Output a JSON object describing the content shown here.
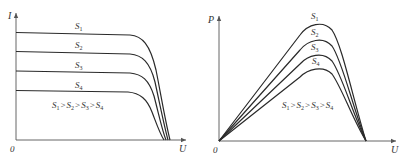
{
  "left_plot": {
    "y_axis_label": "I",
    "x_axis_label": "U",
    "origin_label": "0",
    "curve_labels": [
      "S",
      "S",
      "S",
      "S"
    ],
    "curve_subscripts": [
      "1",
      "2",
      "3",
      "4"
    ],
    "relation": {
      "parts": [
        "S",
        "1",
        ">",
        "S",
        "2",
        ">",
        "S",
        "3",
        ">",
        "S",
        "4"
      ]
    }
  },
  "right_plot": {
    "y_axis_label": "P",
    "x_axis_label": "U",
    "origin_label": "0",
    "curve_labels": [
      "S",
      "S",
      "S",
      "S"
    ],
    "curve_subscripts": [
      "1",
      "2",
      "3",
      "4"
    ],
    "relation": {
      "parts": [
        "S",
        "1",
        ">",
        "S",
        "2",
        ">",
        "S",
        "3",
        ">",
        "S",
        "4"
      ]
    }
  },
  "colors": {
    "curve": "#2a2a2a",
    "axis": "#555555",
    "text": "#333333",
    "background": "#ffffff"
  }
}
